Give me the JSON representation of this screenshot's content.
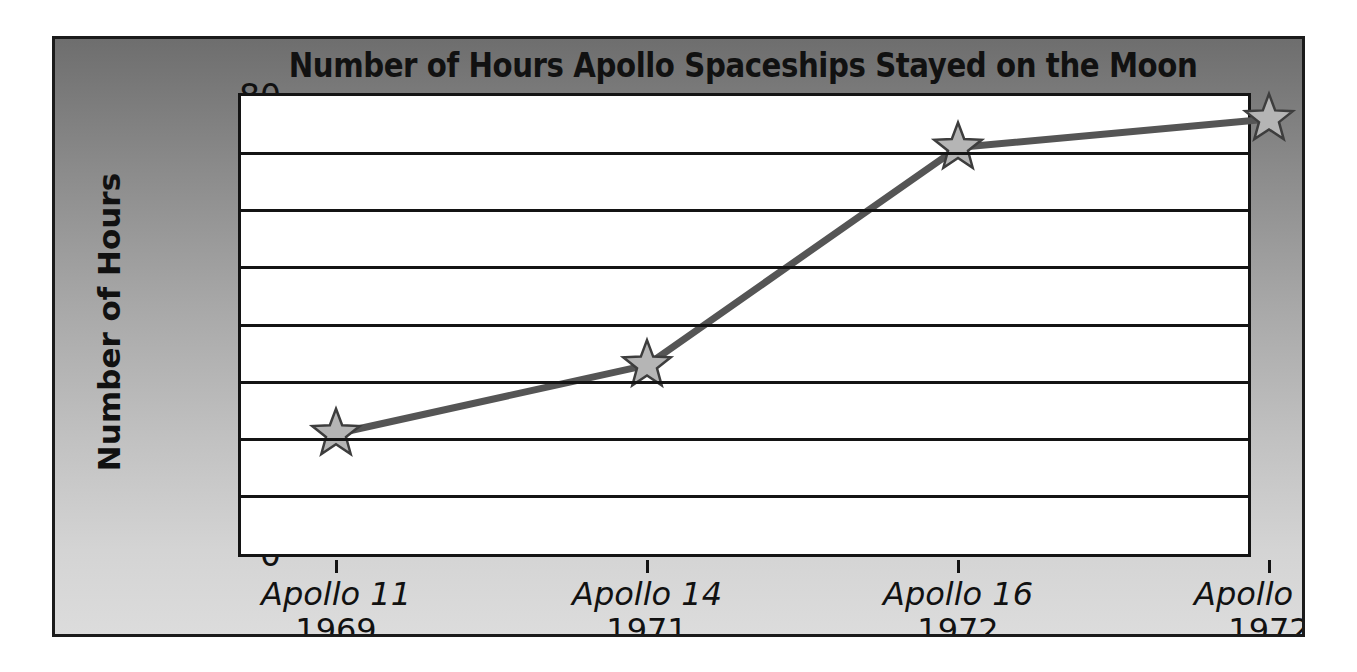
{
  "chart_data": {
    "type": "line",
    "title": "Number of Hours Apollo Spaceships Stayed on the Moon",
    "xlabel": "",
    "ylabel": "Number of Hours",
    "categories": [
      "Apollo 11",
      "Apollo 14",
      "Apollo 16",
      "Apollo 17"
    ],
    "category_sublabels": [
      "1969",
      "1971",
      "1972",
      "1972"
    ],
    "values": [
      21,
      33,
      71,
      76
    ],
    "ylim": [
      0,
      80
    ],
    "yticks": [
      0,
      10,
      20,
      30,
      40,
      50,
      60,
      70,
      80
    ],
    "ytick_labels": [
      "0",
      "10",
      "20",
      "30",
      "40",
      "50",
      "60",
      "70",
      "80"
    ],
    "grid": true,
    "legend": false,
    "marker": "star",
    "series": [
      {
        "name": "Number of Hours",
        "values": [
          21,
          33,
          71,
          76
        ]
      }
    ]
  },
  "style": {
    "line_color": "#555555",
    "marker_fill": "#b5b5b5",
    "marker_stroke": "#3d3d3d",
    "plot_background": "#ffffff",
    "axis_color": "#141414",
    "panel_gradient_top": "#6e6e6e",
    "panel_gradient_bottom": "#dcdcdc",
    "text_color": "#111111"
  }
}
